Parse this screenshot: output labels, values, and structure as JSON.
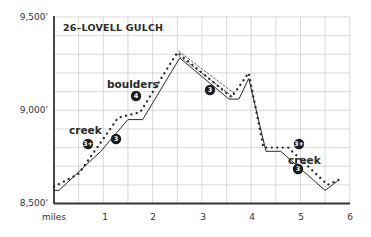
{
  "chart_data": {
    "type": "line",
    "title": "26–LOVELL GULCH",
    "xlabel": "miles",
    "ylabel": "",
    "xlim": [
      0,
      6
    ],
    "ylim": [
      8500,
      9500
    ],
    "x_ticks": [
      "1",
      "2",
      "3",
      "4",
      "5",
      "6"
    ],
    "y_ticks": [
      "8,500'",
      "9,000'",
      "9,500'"
    ],
    "grid": true,
    "series": [
      {
        "name": "elevation profile",
        "style": "solid",
        "points": [
          [
            0.0,
            8570
          ],
          [
            0.1,
            8570
          ],
          [
            0.95,
            8780
          ],
          [
            1.5,
            8950
          ],
          [
            1.8,
            8950
          ],
          [
            2.55,
            9280
          ],
          [
            3.55,
            9060
          ],
          [
            3.75,
            9060
          ],
          [
            3.95,
            9170
          ],
          [
            4.3,
            8780
          ],
          [
            4.6,
            8780
          ],
          [
            5.5,
            8570
          ],
          [
            5.75,
            8620
          ]
        ]
      },
      {
        "name": "difficulty trace",
        "style": "dotted",
        "points": [
          [
            0.0,
            8590
          ],
          [
            0.5,
            8660
          ],
          [
            1.3,
            8960
          ],
          [
            1.75,
            8990
          ],
          [
            2.5,
            9310
          ],
          [
            3.6,
            9070
          ],
          [
            3.95,
            9200
          ],
          [
            4.25,
            8800
          ],
          [
            4.75,
            8800
          ],
          [
            5.55,
            8600
          ],
          [
            5.8,
            8630
          ]
        ]
      },
      {
        "name": "ridge segment",
        "style": "double-dashed",
        "points": [
          [
            2.5,
            9310
          ],
          [
            3.65,
            9080
          ]
        ]
      }
    ],
    "annotations": [
      {
        "text": "creek",
        "x": 0.45,
        "y": 8860
      },
      {
        "text": "boulders",
        "x": 1.65,
        "y": 9140
      },
      {
        "text": "creek",
        "x": 5.05,
        "y": 8800
      }
    ],
    "badges": [
      {
        "label": "3+",
        "x": 0.7,
        "y": 8810
      },
      {
        "label": "3",
        "x": 1.25,
        "y": 8810
      },
      {
        "label": "4",
        "x": 1.7,
        "y": 9060
      },
      {
        "label": "3",
        "x": 3.15,
        "y": 9100
      },
      {
        "label": "3+",
        "x": 5.1,
        "y": 8740
      },
      {
        "label": "3",
        "x": 5.05,
        "y": 8620
      }
    ]
  },
  "labels": {
    "title": "26–LOVELL GULCH",
    "y_top": "9,500'",
    "y_mid": "9,000'",
    "y_bottom": "8,500'",
    "x_axis": "miles",
    "x1": "1",
    "x2": "2",
    "x3": "3",
    "x4": "4",
    "x5": "5",
    "x6": "6",
    "creek1": "creek",
    "boulders": "boulders",
    "creek2": "creek",
    "badge1": "3+",
    "badge2": "3",
    "badge3": "4",
    "badge4": "3",
    "badge5": "3+",
    "badge6": "3"
  },
  "colors": {
    "line": "#2a2a2a",
    "grid": "#c9c9c9",
    "axis": "#333333",
    "badge": "#1a1a1a"
  }
}
